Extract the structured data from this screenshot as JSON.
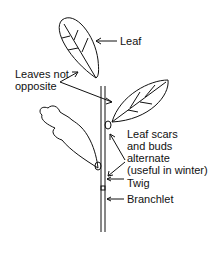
{
  "diagram": {
    "labels": {
      "leaf": "Leaf",
      "leaves_not_opposite_1": "Leaves not",
      "leaves_not_opposite_2": "opposite",
      "scars_1": "Leaf scars",
      "scars_2": "and buds",
      "scars_3": "alternate",
      "scars_4": "(useful in winter)",
      "twig": "Twig",
      "branchlet": "Branchlet"
    },
    "colors": {
      "ink": "#111111",
      "background": "#ffffff"
    }
  }
}
